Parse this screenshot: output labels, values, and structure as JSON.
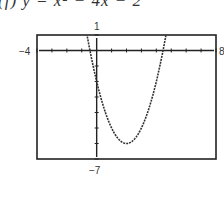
{
  "caption": {
    "text": "(f)  y = x² − 4x − 2",
    "note": "caption clipped at top edge; only lower portion of glyphs visible"
  },
  "chart_data": {
    "type": "line",
    "title": "y = x² − 4x − 2",
    "xlabel": "",
    "ylabel": "",
    "xlim": [
      -4,
      8
    ],
    "ylim": [
      -7,
      1
    ],
    "x_scale_ticks": 1,
    "y_scale_ticks": 1,
    "grid": false,
    "legend": null,
    "window_labels": {
      "xmin": "−4",
      "xmax": "8",
      "ymin": "−7",
      "ymax": "1"
    },
    "series": [
      {
        "name": "y = x² − 4x − 2",
        "style": "dotted-pixel (graphing calculator)",
        "x": [
          -0.8,
          -0.45,
          0,
          0.5,
          1,
          1.5,
          2,
          2.5,
          3,
          3.5,
          4,
          4.45,
          4.8
        ],
        "values": [
          1.84,
          0,
          -2,
          -3.75,
          -5,
          -5.75,
          -6,
          -5.75,
          -5,
          -3.75,
          -2,
          0,
          1.84
        ]
      }
    ],
    "annotations": {
      "vertex": [
        2,
        -6
      ],
      "x_intercepts": [
        -0.45,
        4.45
      ],
      "y_intercept": -2
    }
  },
  "frame": {
    "left": 37,
    "top": 35,
    "right": 216,
    "bottom": 159,
    "stroke": "#222222"
  }
}
